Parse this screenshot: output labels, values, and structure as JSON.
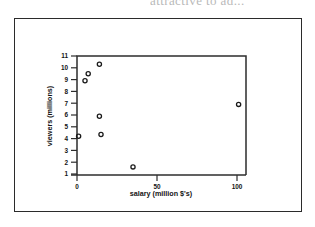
{
  "page": {
    "background_color": "#ffffff",
    "border_color": "#2b2b2b",
    "scan_text_fragment": "attractive to ad..."
  },
  "chart_data": {
    "type": "scatter",
    "title": "",
    "xlabel": "salary (million $'s)",
    "ylabel": "viewers (millions)",
    "xlim": [
      -5,
      112
    ],
    "ylim": [
      0.5,
      11.3
    ],
    "xticks": [
      0,
      50,
      100
    ],
    "yticks": [
      1,
      2,
      3,
      4,
      5,
      6,
      7,
      8,
      9,
      10,
      11
    ],
    "grid": false,
    "legend": null,
    "marker": "open-circle",
    "marker_color": "#1a1a1a",
    "points": [
      {
        "x": 1,
        "y": 4.2
      },
      {
        "x": 5,
        "y": 8.9
      },
      {
        "x": 7,
        "y": 9.5
      },
      {
        "x": 14,
        "y": 10.3
      },
      {
        "x": 14,
        "y": 5.9
      },
      {
        "x": 15,
        "y": 4.35
      },
      {
        "x": 35,
        "y": 1.6
      },
      {
        "x": 101,
        "y": 6.9
      }
    ]
  }
}
